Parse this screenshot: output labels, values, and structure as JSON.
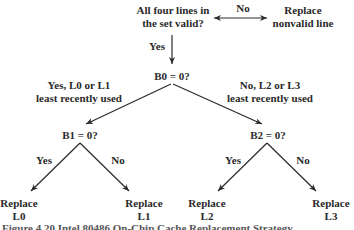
{
  "diagram": {
    "type": "flowchart",
    "nodes": {
      "start": {
        "line1": "All four lines in",
        "line2": "the set valid?"
      },
      "replace_nonvalid": {
        "line1": "Replace",
        "line2": "nonvalid line"
      },
      "b0": {
        "label": "B0 = 0?"
      },
      "b1": {
        "label": "B1 = 0?"
      },
      "b2": {
        "label": "B2 = 0?"
      },
      "replace_l0": {
        "line1": "Replace",
        "line2": "L0"
      },
      "replace_l1": {
        "line1": "Replace",
        "line2": "L1"
      },
      "replace_l2": {
        "line1": "Replace",
        "line2": "L2"
      },
      "replace_l3": {
        "line1": "Replace",
        "line2": "L3"
      }
    },
    "edges": {
      "start_to_replace": {
        "label": "No"
      },
      "start_to_b0": {
        "label": "Yes"
      },
      "b0_to_b1": {
        "line1": "Yes, L0 or L1",
        "line2": "least recently used"
      },
      "b0_to_b2": {
        "line1": "No, L2 or L3",
        "line2": "least recently used"
      },
      "b1_to_l0": {
        "label": "Yes"
      },
      "b1_to_l1": {
        "label": "No"
      },
      "b2_to_l2": {
        "label": "Yes"
      },
      "b2_to_l3": {
        "label": "No"
      }
    },
    "colors": {
      "ink": "#2a2a2a",
      "background": "#ffffff"
    }
  },
  "caption": {
    "text": "Figure 4.20  Intel 80486 On-Chip Cache Replacement Strategy"
  }
}
